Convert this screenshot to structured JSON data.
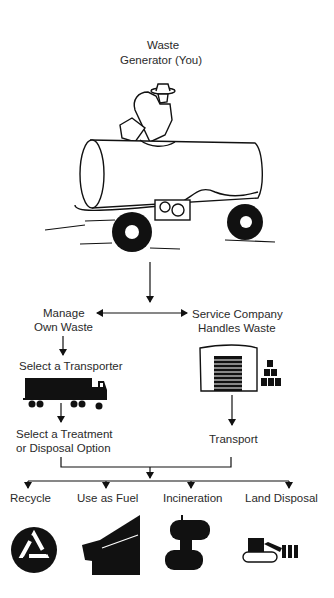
{
  "title": {
    "line1": "Waste",
    "line2": "Generator (You)"
  },
  "branches": {
    "left": {
      "line1": "Manage",
      "line2": "Own Waste"
    },
    "right": {
      "line1": "Service Company",
      "line2": "Handles Waste"
    }
  },
  "steps": {
    "select_transporter": "Select a Transporter",
    "select_option_line1": "Select a Treatment",
    "select_option_line2": "or Disposal Option",
    "transport": "Transport"
  },
  "options": [
    {
      "label": "Recycle",
      "icon": "recycle-icon"
    },
    {
      "label": "Use as Fuel",
      "icon": "kiln-icon"
    },
    {
      "label": "Incineration",
      "icon": "incinerator-icon"
    },
    {
      "label": "Land Disposal",
      "icon": "bulldozer-icon"
    }
  ],
  "colors": {
    "ink": "#111111",
    "background": "#ffffff"
  }
}
